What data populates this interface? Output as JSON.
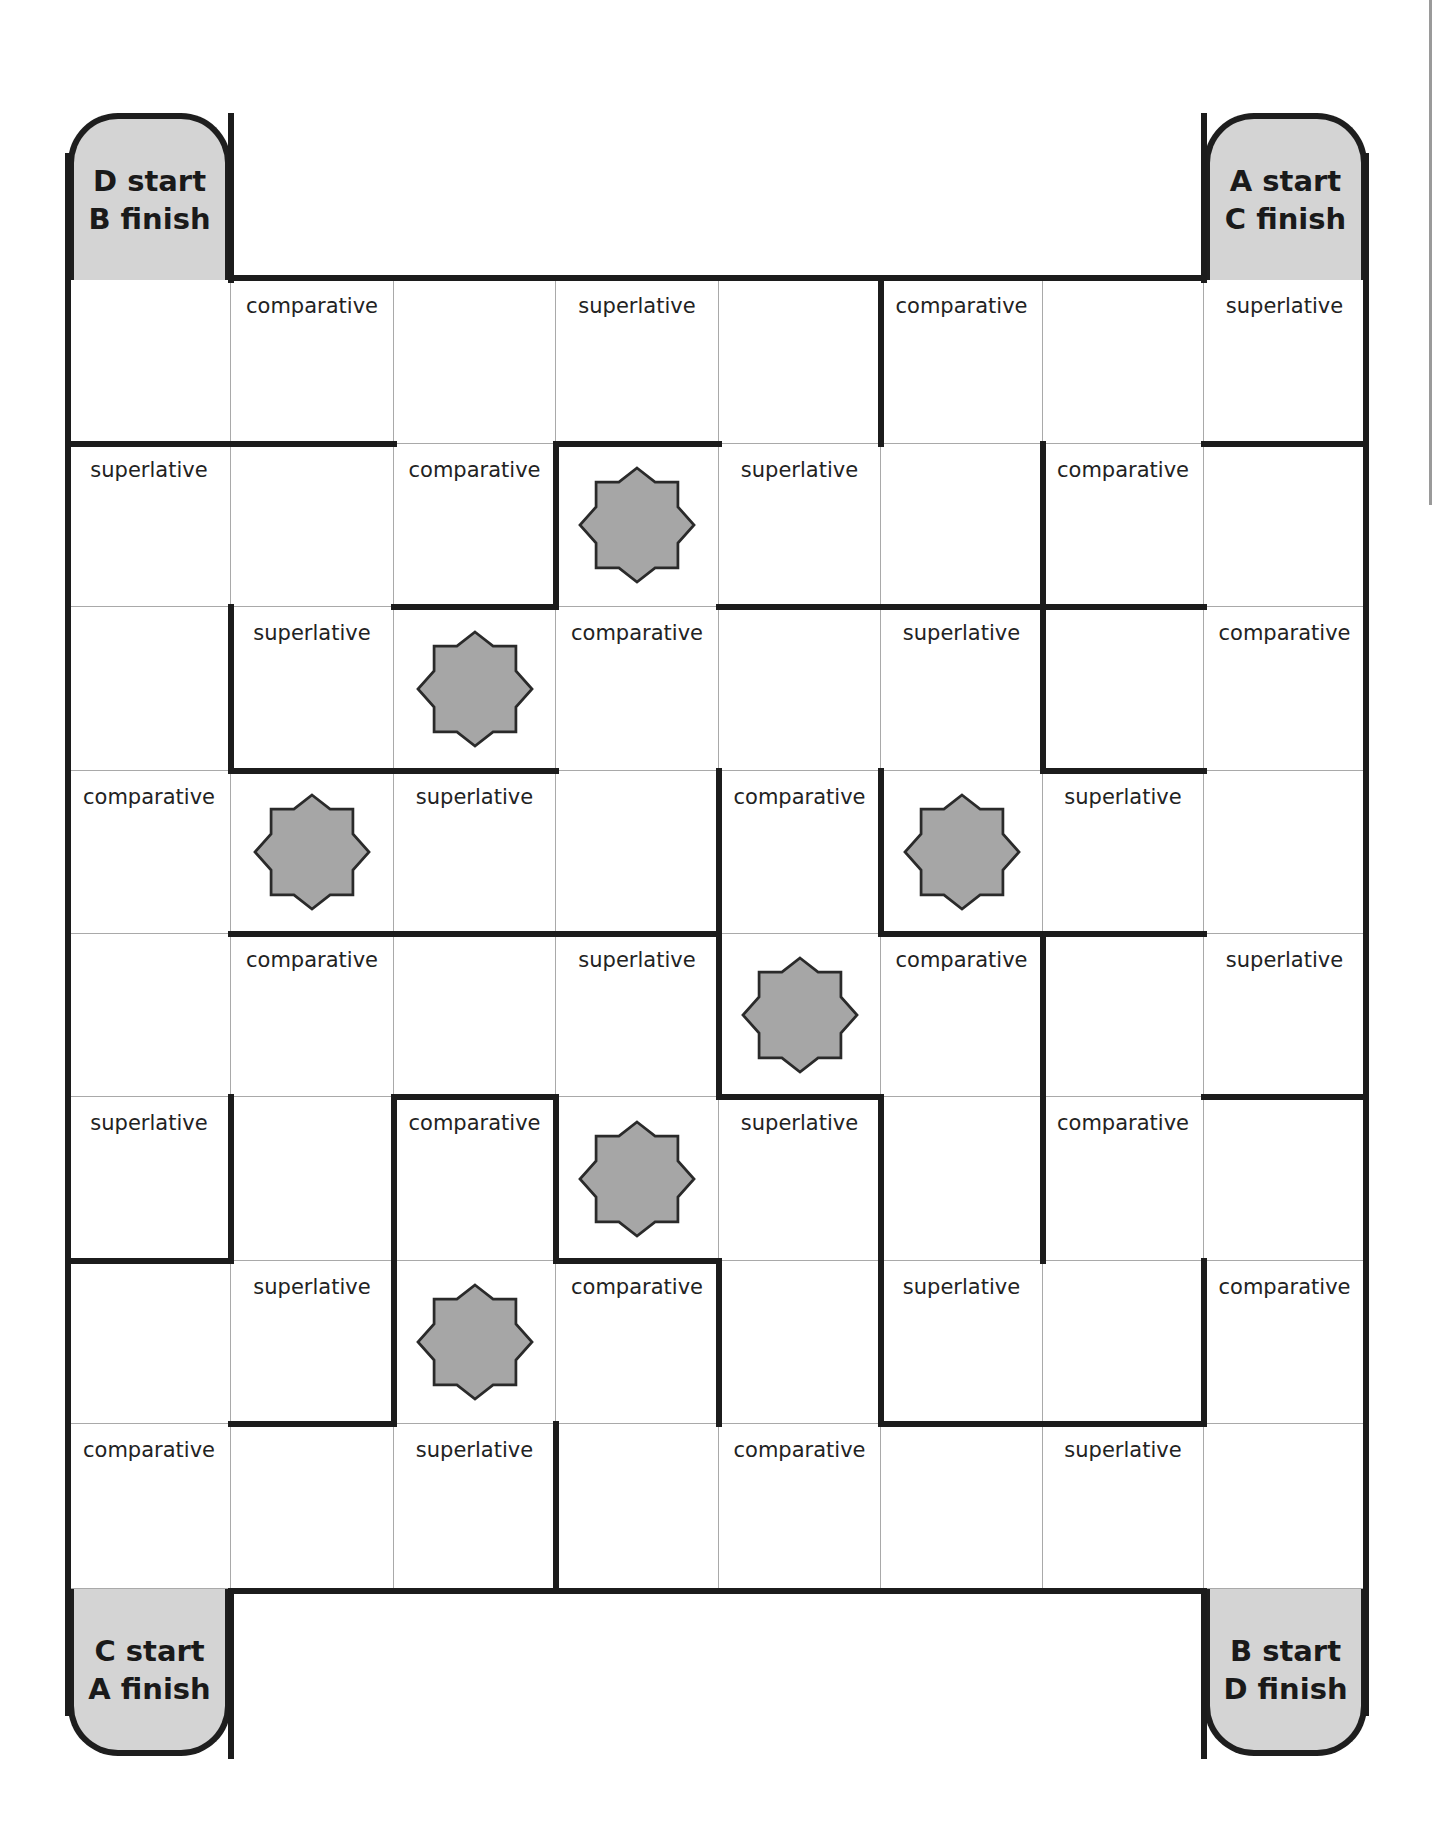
{
  "board": {
    "columns": 8,
    "rows": 8,
    "corners": [
      {
        "id": "top-left",
        "line1": "D start",
        "line2": "B finish"
      },
      {
        "id": "top-right",
        "line1": "A start",
        "line2": "C finish"
      },
      {
        "id": "bottom-left",
        "line1": "C start",
        "line2": "A finish"
      },
      {
        "id": "bottom-right",
        "line1": "B start",
        "line2": "D finish"
      }
    ],
    "cells": [
      [
        "",
        "comparative",
        "",
        "superlative",
        "",
        "comparative",
        "",
        "superlative"
      ],
      [
        "superlative",
        "",
        "comparative",
        "STAR",
        "superlative",
        "",
        "comparative",
        ""
      ],
      [
        "",
        "superlative",
        "STAR",
        "comparative",
        "",
        "superlative",
        "",
        "comparative"
      ],
      [
        "comparative",
        "STAR",
        "superlative",
        "",
        "comparative",
        "STAR",
        "superlative",
        ""
      ],
      [
        "",
        "comparative",
        "",
        "superlative",
        "STAR",
        "comparative",
        "",
        "superlative"
      ],
      [
        "superlative",
        "",
        "comparative",
        "STAR",
        "superlative",
        "",
        "comparative",
        ""
      ],
      [
        "",
        "superlative",
        "STAR",
        "comparative",
        "",
        "superlative",
        "",
        "comparative"
      ],
      [
        "comparative",
        "",
        "superlative",
        "",
        "comparative",
        "",
        "superlative",
        ""
      ]
    ],
    "walls_horizontal": [
      {
        "line": 1,
        "from": 0,
        "to": 2
      },
      {
        "line": 1,
        "from": 3,
        "to": 4
      },
      {
        "line": 1,
        "from": 7,
        "to": 8
      },
      {
        "line": 2,
        "from": 2,
        "to": 3
      },
      {
        "line": 2,
        "from": 4,
        "to": 7
      },
      {
        "line": 3,
        "from": 1,
        "to": 3
      },
      {
        "line": 3,
        "from": 6,
        "to": 7
      },
      {
        "line": 4,
        "from": 1,
        "to": 4
      },
      {
        "line": 4,
        "from": 5,
        "to": 7
      },
      {
        "line": 5,
        "from": 2,
        "to": 3
      },
      {
        "line": 5,
        "from": 4,
        "to": 5
      },
      {
        "line": 5,
        "from": 7,
        "to": 8
      },
      {
        "line": 6,
        "from": 0,
        "to": 1
      },
      {
        "line": 6,
        "from": 3,
        "to": 4
      },
      {
        "line": 7,
        "from": 1,
        "to": 2
      },
      {
        "line": 7,
        "from": 5,
        "to": 7
      }
    ],
    "walls_vertical": [
      {
        "line": 5,
        "from": 0,
        "to": 1
      },
      {
        "line": 3,
        "from": 1,
        "to": 2
      },
      {
        "line": 6,
        "from": 1,
        "to": 3
      },
      {
        "line": 1,
        "from": 2,
        "to": 3
      },
      {
        "line": 4,
        "from": 3,
        "to": 5
      },
      {
        "line": 5,
        "from": 3,
        "to": 4
      },
      {
        "line": 6,
        "from": 4,
        "to": 6
      },
      {
        "line": 1,
        "from": 5,
        "to": 6
      },
      {
        "line": 2,
        "from": 5,
        "to": 7
      },
      {
        "line": 3,
        "from": 5,
        "to": 6
      },
      {
        "line": 5,
        "from": 5,
        "to": 7
      },
      {
        "line": 4,
        "from": 6,
        "to": 7
      },
      {
        "line": 7,
        "from": 6,
        "to": 7
      },
      {
        "line": 3,
        "from": 7,
        "to": 8
      }
    ],
    "star_icon": "eight-point-star",
    "colors": {
      "star_fill": "#a6a6a6",
      "corner_fill": "#d4d4d4",
      "wall": "#1c1c1c",
      "grid": "#a9a9a9"
    }
  }
}
